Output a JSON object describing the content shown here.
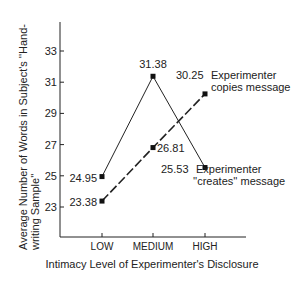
{
  "chart_data": {
    "type": "line",
    "title": "",
    "xlabel": "Intimacy Level of Experimenter's Disclosure",
    "ylabel_line1": "Average Number of Words in Subject's ''Hand-",
    "ylabel_line2": "writing Sample''",
    "categories": [
      "LOW",
      "MEDIUM",
      "HIGH"
    ],
    "yticks": [
      23,
      25,
      27,
      29,
      31,
      33
    ],
    "ylim": [
      21.5,
      35
    ],
    "grid": false,
    "series": [
      {
        "name": "Experimenter ''creates'' message",
        "label_line1": "Experimenter",
        "label_line2": "''creates'' message",
        "style": "solid",
        "values": [
          24.95,
          31.38,
          25.53
        ],
        "value_labels": [
          "24.95",
          "31.38",
          "25.53"
        ]
      },
      {
        "name": "Experimenter copies message",
        "label_line1": "Experimenter",
        "label_line2": "copies message",
        "style": "dashed",
        "values": [
          23.38,
          26.81,
          30.25
        ],
        "value_labels": [
          "23.38",
          "26.81",
          "30.25"
        ]
      }
    ]
  }
}
